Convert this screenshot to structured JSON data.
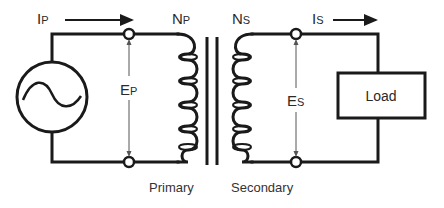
{
  "diagram": {
    "type": "transformer-circuit",
    "labels": {
      "primary_current": {
        "main": "I",
        "sub": "P"
      },
      "secondary_current": {
        "main": "I",
        "sub": "S"
      },
      "primary_turns": {
        "main": "N",
        "sub": "P"
      },
      "secondary_turns": {
        "main": "N",
        "sub": "S"
      },
      "primary_voltage": {
        "main": "E",
        "sub": "P"
      },
      "secondary_voltage": {
        "main": "E",
        "sub": "S"
      },
      "load": "Load",
      "primary_caption": "Primary",
      "secondary_caption": "Secondary"
    },
    "components": [
      {
        "name": "AC source",
        "symbol": "sine-in-circle"
      },
      {
        "name": "Primary winding",
        "turns_drawn": 5
      },
      {
        "name": "Iron core",
        "lines": 2
      },
      {
        "name": "Secondary winding",
        "turns_drawn": 5
      },
      {
        "name": "Load",
        "symbol": "box"
      }
    ],
    "colors": {
      "line": "#1a1a1a",
      "text": "#2a2a2a",
      "background": "#ffffff"
    }
  }
}
